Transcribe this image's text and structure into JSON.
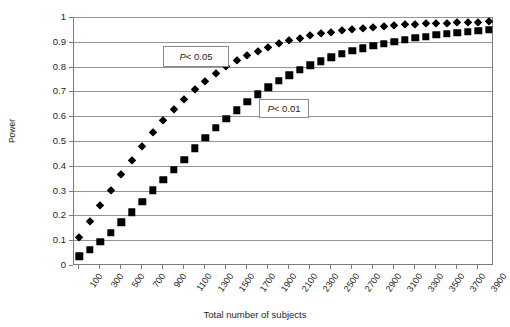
{
  "chart_data": {
    "type": "scatter",
    "title": "",
    "xlabel": "Total number of subjects",
    "ylabel": "Power",
    "ylim": [
      0,
      1
    ],
    "yticks": [
      0,
      0.1,
      0.2,
      0.3,
      0.4,
      0.5,
      0.6,
      0.7,
      0.8,
      0.9,
      1
    ],
    "ytick_labels": [
      "0",
      "0.1",
      "0.2",
      "0.3",
      "0.4",
      "0.5",
      "0.6",
      "0.7",
      "0.8",
      "0.9",
      "1"
    ],
    "grid": "horizontal",
    "legend": "none",
    "x": [
      100,
      200,
      300,
      400,
      500,
      600,
      700,
      800,
      900,
      1000,
      1100,
      1200,
      1300,
      1400,
      1500,
      1600,
      1700,
      1800,
      1900,
      2000,
      2100,
      2200,
      2300,
      2400,
      2500,
      2600,
      2700,
      2800,
      2900,
      3000,
      3100,
      3200,
      3300,
      3400,
      3500,
      3600,
      3700,
      3800,
      3900,
      4000
    ],
    "xtick_labels": [
      "100",
      "300",
      "500",
      "700",
      "900",
      "1100",
      "1300",
      "1500",
      "1700",
      "1900",
      "2100",
      "2300",
      "2500",
      "2700",
      "2900",
      "3100",
      "3300",
      "3500",
      "3700",
      "3900"
    ],
    "xtick_label_step": 2,
    "series": [
      {
        "name": "P < 0.05",
        "marker": "diamond",
        "color": "#000000",
        "values": [
          0.112,
          0.179,
          0.243,
          0.304,
          0.368,
          0.425,
          0.481,
          0.535,
          0.585,
          0.63,
          0.671,
          0.709,
          0.743,
          0.774,
          0.801,
          0.825,
          0.846,
          0.864,
          0.88,
          0.894,
          0.906,
          0.917,
          0.926,
          0.934,
          0.941,
          0.947,
          0.952,
          0.957,
          0.961,
          0.964,
          0.967,
          0.97,
          0.972,
          0.974,
          0.976,
          0.977,
          0.979,
          0.98,
          0.981,
          0.982
        ]
      },
      {
        "name": "P < 0.01",
        "marker": "square",
        "color": "#000000",
        "values": [
          0.035,
          0.061,
          0.094,
          0.131,
          0.172,
          0.212,
          0.256,
          0.301,
          0.343,
          0.385,
          0.425,
          0.47,
          0.514,
          0.553,
          0.59,
          0.624,
          0.658,
          0.689,
          0.717,
          0.742,
          0.765,
          0.786,
          0.805,
          0.822,
          0.837,
          0.851,
          0.863,
          0.874,
          0.884,
          0.893,
          0.901,
          0.908,
          0.915,
          0.921,
          0.927,
          0.932,
          0.937,
          0.941,
          0.945,
          0.948
        ]
      }
    ],
    "annotations": [
      {
        "text_prefix": "P",
        "text_suffix": " < 0.05",
        "full": "P < 0.05"
      },
      {
        "text_prefix": "P",
        "text_suffix": " < 0.01",
        "full": "P < 0.01"
      }
    ]
  },
  "axis": {
    "y_title": "Power",
    "x_title": "Total number of subjects"
  },
  "annotations": {
    "p05": {
      "italic": "P",
      "rest": " < 0.05"
    },
    "p01": {
      "italic": "P",
      "rest": " < 0.01"
    }
  }
}
